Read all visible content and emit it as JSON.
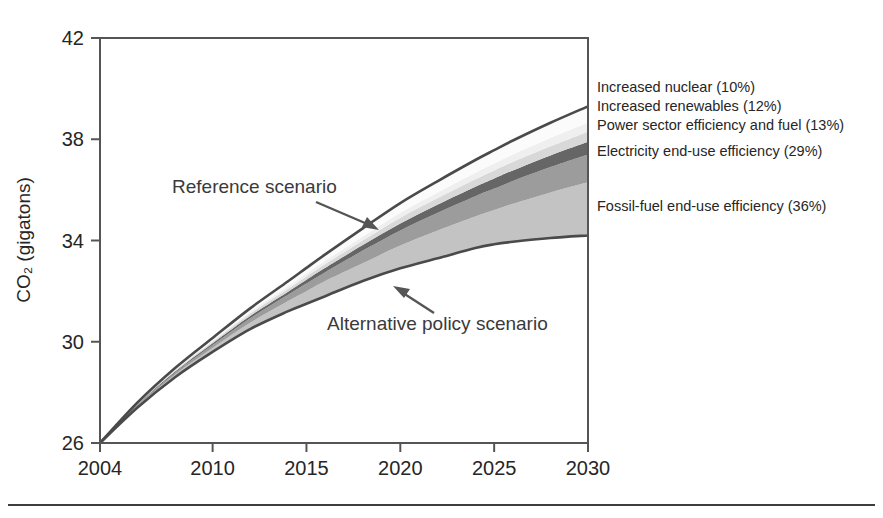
{
  "figure": {
    "name": "co2-emissions-scenario-chart",
    "width": 883,
    "height": 518,
    "background_color": "#ffffff",
    "bottom_rule_color": "#3d3d3d"
  },
  "chart_data": {
    "type": "area",
    "title": "",
    "subtitle": "",
    "xlabel": "",
    "ylabel": "CO₂ (gigatons)",
    "xlim": [
      2004,
      2030
    ],
    "ylim": [
      26,
      42
    ],
    "grid": false,
    "legend_position": "right",
    "x_tick_labels": [
      "2004",
      "2010",
      "2015",
      "2020",
      "2025",
      "2030"
    ],
    "x_ticks": [
      2004,
      2010,
      2015,
      2020,
      2025,
      2030
    ],
    "y_tick_labels": [
      "26",
      "30",
      "34",
      "38",
      "42"
    ],
    "y_ticks": [
      26,
      30,
      34,
      38,
      42
    ],
    "x": [
      2004,
      2006,
      2008,
      2010,
      2012,
      2014,
      2015,
      2016,
      2018,
      2020,
      2022,
      2024,
      2025,
      2026,
      2028,
      2030
    ],
    "series": [
      {
        "name": "Alternative policy scenario",
        "role": "baseline-curve",
        "color": "#4a4a4a",
        "values": [
          26.0,
          27.4,
          28.6,
          29.6,
          30.5,
          31.2,
          31.5,
          31.8,
          32.4,
          32.9,
          33.3,
          33.7,
          33.85,
          33.95,
          34.1,
          34.2
        ]
      },
      {
        "name": "Fossil-fuel end-use efficiency (36%)",
        "role": "band",
        "share_percent": 36,
        "color": "#c3c3c3",
        "cumulative_top": [
          26.0,
          27.45,
          28.7,
          29.75,
          30.75,
          31.6,
          32.0,
          32.4,
          33.1,
          33.8,
          34.4,
          34.95,
          35.2,
          35.45,
          35.9,
          36.3
        ]
      },
      {
        "name": "Electricity end-use efficiency (29%)",
        "role": "band",
        "share_percent": 29,
        "color": "#9c9c9c",
        "cumulative_top": [
          26.0,
          27.5,
          28.78,
          29.87,
          30.93,
          31.85,
          32.3,
          32.75,
          33.6,
          34.4,
          35.1,
          35.75,
          36.05,
          36.35,
          36.9,
          37.4
        ]
      },
      {
        "name": "Power sector efficiency and fuel (13%)",
        "role": "band",
        "share_percent": 13,
        "color": "#666666",
        "cumulative_top": [
          26.0,
          27.52,
          28.82,
          29.94,
          31.02,
          31.97,
          32.45,
          32.92,
          33.82,
          34.67,
          35.42,
          36.12,
          36.45,
          36.77,
          37.36,
          37.9
        ]
      },
      {
        "name": "Increased renewables (12%)",
        "role": "band",
        "share_percent": 12,
        "color": "#d8d8d8",
        "cumulative_top": [
          26.0,
          27.54,
          28.86,
          30.0,
          31.11,
          32.08,
          32.58,
          33.07,
          34.0,
          34.9,
          35.68,
          36.42,
          36.77,
          37.1,
          37.72,
          38.3
        ]
      },
      {
        "name": "Increased nuclear (10%)",
        "role": "band",
        "share_percent": 10,
        "color": "#efefef",
        "cumulative_top": [
          26.0,
          27.56,
          28.9,
          30.05,
          31.18,
          32.18,
          32.7,
          33.2,
          34.16,
          35.1,
          35.9,
          36.68,
          37.04,
          37.4,
          38.05,
          38.65
        ]
      },
      {
        "name": "Reference scenario",
        "role": "top-curve",
        "color": "#4a4a4a",
        "values": [
          26.0,
          27.6,
          28.96,
          30.15,
          31.32,
          32.38,
          32.92,
          33.45,
          34.48,
          35.48,
          36.35,
          37.18,
          37.57,
          37.95,
          38.65,
          39.3
        ]
      }
    ],
    "legend_entries": [
      {
        "label": "Increased nuclear (10%)",
        "color": "#efefef"
      },
      {
        "label": "Increased renewables (12%)",
        "color": "#d8d8d8"
      },
      {
        "label": "Power sector efficiency and fuel (13%)",
        "color": "#666666"
      },
      {
        "label": "Electricity end-use efficiency (29%)",
        "color": "#9c9c9c"
      },
      {
        "label": "Fossil-fuel end-use efficiency (36%)",
        "color": "#c3c3c3"
      }
    ],
    "annotations": [
      {
        "text": "Reference scenario",
        "points_to": "upper boundary curve",
        "direction": "down-right"
      },
      {
        "text": "Alternative policy scenario",
        "points_to": "lower boundary curve",
        "direction": "up-left"
      }
    ]
  },
  "axis": {
    "y_title": "CO₂ (gigatons)",
    "y_labels": [
      "42",
      "38",
      "34",
      "30",
      "26"
    ],
    "x_labels": [
      "2004",
      "2010",
      "2015",
      "2020",
      "2025",
      "2030"
    ]
  },
  "legend": {
    "items": [
      {
        "label": "Increased nuclear (10%)"
      },
      {
        "label": "Increased renewables (12%)"
      },
      {
        "label": "Power sector efficiency and fuel (13%)"
      },
      {
        "label": "Electricity end-use efficiency (29%)"
      },
      {
        "label": "Fossil-fuel end-use efficiency (36%)"
      }
    ]
  },
  "annotations": {
    "reference": "Reference scenario",
    "alternative": "Alternative policy scenario"
  }
}
